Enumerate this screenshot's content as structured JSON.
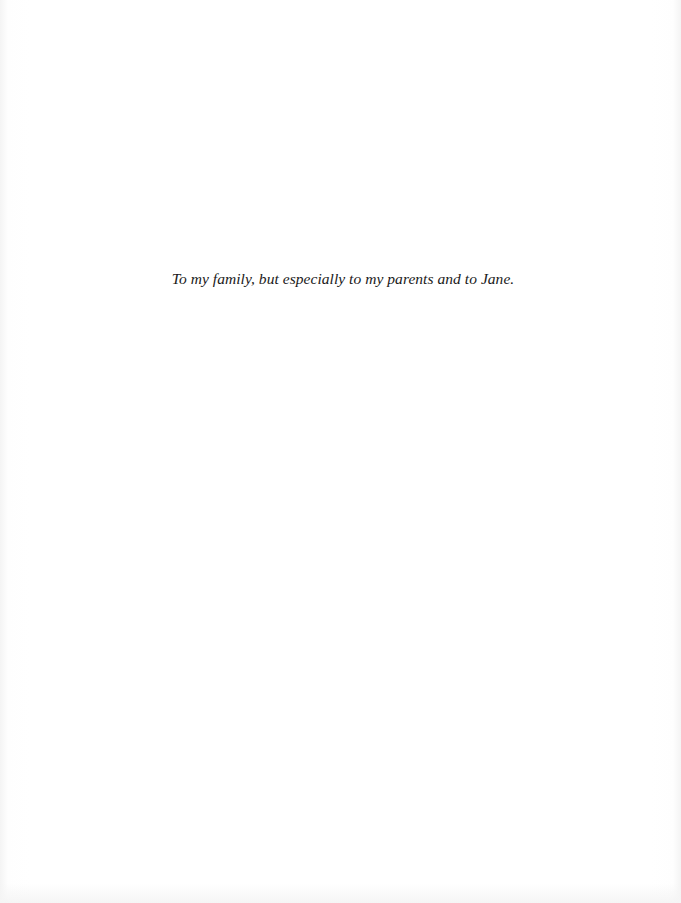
{
  "page": {
    "dedication": "To my family, but especially to my parents and to Jane."
  }
}
